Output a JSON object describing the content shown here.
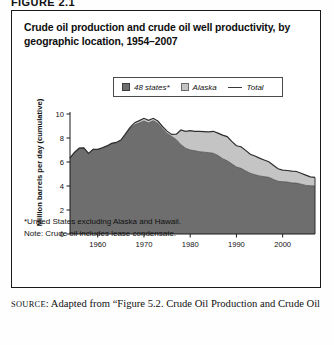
{
  "figure": {
    "number_label": "FIGURE 2.1",
    "title": "Crude oil production and crude oil well productivity, by geographic location, 1954–2007"
  },
  "legend": {
    "position": "top-center",
    "items": [
      {
        "label": "48 states*",
        "swatch": "dark-gray-square",
        "color": "#6e6e6e",
        "marker": "square"
      },
      {
        "label": "Alaska",
        "swatch": "light-gray-square",
        "color": "#c4c4c4",
        "marker": "square"
      },
      {
        "label": "Total",
        "swatch": "line",
        "color": "#3a3a3a",
        "marker": "line"
      }
    ]
  },
  "axes": {
    "ylabel": "Million barrels per day (cumulative)",
    "yticks": [
      "0",
      "2",
      "4",
      "6",
      "8",
      "10"
    ],
    "xticks": [
      "1960",
      "1970",
      "1980",
      "1990",
      "2000"
    ]
  },
  "notes": {
    "footnote": "*United States excluding Alaska and Hawaii.",
    "note": "Note:  Crude oil includes lease condensate."
  },
  "source": {
    "prefix": "SOURCE",
    "text": ": Adapted from “Figure 5.2. Crude Oil Production and Crude Oil"
  },
  "chart_data": {
    "type": "area",
    "stacked": true,
    "title": "Crude oil production and crude oil well productivity, by geographic location, 1954–2007",
    "xlabel": "",
    "ylabel": "Million barrels per day (cumulative)",
    "xlim": [
      1954,
      2007
    ],
    "ylim": [
      0,
      10
    ],
    "xticks": [
      1960,
      1970,
      1980,
      1990,
      2000
    ],
    "yticks": [
      0,
      2,
      4,
      6,
      8,
      10
    ],
    "grid": false,
    "legend_position": "top-center",
    "colors": {
      "48_states": "#6e6e6e",
      "alaska": "#c4c4c4",
      "total_line": "#2e2e2e"
    },
    "x": [
      1954,
      1955,
      1956,
      1957,
      1958,
      1959,
      1960,
      1961,
      1962,
      1963,
      1964,
      1965,
      1966,
      1967,
      1968,
      1969,
      1970,
      1971,
      1972,
      1973,
      1974,
      1975,
      1976,
      1977,
      1978,
      1979,
      1980,
      1981,
      1982,
      1983,
      1984,
      1985,
      1986,
      1987,
      1988,
      1989,
      1990,
      1991,
      1992,
      1993,
      1994,
      1995,
      1996,
      1997,
      1998,
      1999,
      2000,
      2001,
      2002,
      2003,
      2004,
      2005,
      2006,
      2007
    ],
    "series": [
      {
        "name": "48 states*",
        "values": [
          6.34,
          6.81,
          7.15,
          7.17,
          6.71,
          7.05,
          7.04,
          7.18,
          7.33,
          7.54,
          7.61,
          7.8,
          8.3,
          8.81,
          9.1,
          9.24,
          9.41,
          9.25,
          9.44,
          9.21,
          8.77,
          8.38,
          8.13,
          7.86,
          7.44,
          7.15,
          7.0,
          6.94,
          6.86,
          6.82,
          6.78,
          6.73,
          6.54,
          6.28,
          6.1,
          5.85,
          5.58,
          5.47,
          5.26,
          5.06,
          4.94,
          4.84,
          4.78,
          4.72,
          4.55,
          4.39,
          4.36,
          4.33,
          4.26,
          4.24,
          4.15,
          4.05,
          4.02,
          4.0
        ],
        "unit": "million barrels per day"
      },
      {
        "name": "Alaska",
        "values": [
          0.0,
          0.0,
          0.0,
          0.0,
          0.0,
          0.01,
          0.01,
          0.01,
          0.01,
          0.01,
          0.02,
          0.03,
          0.05,
          0.08,
          0.18,
          0.21,
          0.23,
          0.23,
          0.2,
          0.2,
          0.19,
          0.19,
          0.17,
          0.46,
          1.23,
          1.4,
          1.62,
          1.61,
          1.69,
          1.71,
          1.73,
          1.83,
          1.87,
          1.96,
          2.02,
          1.87,
          1.77,
          1.8,
          1.71,
          1.58,
          1.56,
          1.48,
          1.39,
          1.3,
          1.18,
          1.05,
          0.97,
          0.96,
          0.98,
          0.97,
          0.91,
          0.86,
          0.74,
          0.72
        ],
        "unit": "million barrels per day"
      }
    ],
    "total": {
      "name": "Total",
      "values": [
        6.34,
        6.81,
        7.15,
        7.17,
        6.71,
        7.06,
        7.05,
        7.19,
        7.34,
        7.55,
        7.63,
        7.83,
        8.35,
        8.89,
        9.28,
        9.45,
        9.64,
        9.48,
        9.64,
        9.41,
        8.96,
        8.57,
        8.3,
        8.32,
        8.67,
        8.55,
        8.62,
        8.55,
        8.55,
        8.53,
        8.51,
        8.56,
        8.41,
        8.24,
        8.12,
        7.72,
        7.35,
        7.27,
        6.97,
        6.64,
        6.5,
        6.32,
        6.17,
        6.02,
        5.73,
        5.44,
        5.33,
        5.29,
        5.24,
        5.21,
        5.06,
        4.91,
        4.76,
        4.72
      ],
      "unit": "million barrels per day"
    }
  }
}
